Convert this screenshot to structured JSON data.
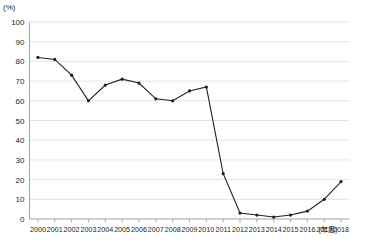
{
  "chart_data": {
    "type": "line",
    "title": "",
    "subtitle": "",
    "unit_label": "(%)",
    "xlabel": "(年度)",
    "ylabel": "",
    "categories": [
      "2000",
      "2001",
      "2002",
      "2003",
      "2004",
      "2005",
      "2006",
      "2007",
      "2008",
      "2009",
      "2010",
      "2011",
      "2012",
      "2013",
      "2014",
      "2015",
      "2016",
      "2017",
      "2018"
    ],
    "x": [
      2000,
      2001,
      2002,
      2003,
      2004,
      2005,
      2006,
      2007,
      2008,
      2009,
      2010,
      2011,
      2012,
      2013,
      2014,
      2015,
      2016,
      2017,
      2018
    ],
    "values": [
      82,
      81,
      73,
      60,
      68,
      71,
      69,
      61,
      60,
      65,
      67,
      23,
      3,
      2,
      1,
      2,
      4,
      10,
      19
    ],
    "series": [
      {
        "name": "",
        "values": [
          82,
          81,
          73,
          60,
          68,
          71,
          69,
          61,
          60,
          65,
          67,
          23,
          3,
          2,
          1,
          2,
          4,
          10,
          19
        ]
      }
    ],
    "ylim": [
      0,
      100
    ],
    "ytick_labels": [
      "100",
      "90",
      "80",
      "70",
      "60",
      "50",
      "40",
      "30",
      "20",
      "10",
      "0"
    ],
    "ytick_values": [
      100,
      90,
      80,
      70,
      60,
      50,
      40,
      30,
      20,
      10,
      0
    ],
    "grid": true,
    "grid_axis": "y",
    "legend": false,
    "legend_position": "none",
    "markers": true,
    "annotations": []
  },
  "colors": {
    "line": "#231f20",
    "marker": "#231f20",
    "grid": "#d9d9d9",
    "axis": "#8c8c8c",
    "background": "#ffffff",
    "text": "#231f20"
  }
}
